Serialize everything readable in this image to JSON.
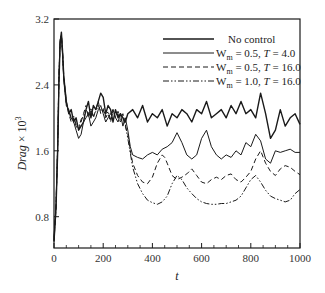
{
  "chart_data": {
    "type": "line",
    "title": "",
    "xlabel": "t",
    "ylabel": "Drag × 10³",
    "ylabel_parts": {
      "italic": "Drag",
      "rest": " × 10",
      "sup": "3"
    },
    "xlim": [
      0,
      1000
    ],
    "ylim": [
      0.42,
      3.2
    ],
    "xticks": [
      0,
      200,
      400,
      600,
      800,
      1000
    ],
    "xtick_labels": [
      "0",
      "200",
      "400",
      "600",
      "800",
      "1000"
    ],
    "yticks": [
      0.8,
      1.6,
      2.4,
      3.2
    ],
    "ytick_labels": [
      "0.8",
      "1.6",
      "2.4",
      "3.2"
    ],
    "grid": false,
    "legend_position": "upper right",
    "series": [
      {
        "name": "No control",
        "label_parts": [
          "No control"
        ],
        "style": "solid",
        "width": 1.4,
        "color": "#1a1a1a",
        "x": [
          0,
          8,
          15,
          20,
          25,
          30,
          35,
          40,
          50,
          60,
          70,
          80,
          90,
          100,
          110,
          120,
          130,
          140,
          150,
          160,
          170,
          180,
          190,
          200,
          210,
          220,
          230,
          240,
          250,
          260,
          270,
          280,
          290,
          300,
          320,
          340,
          360,
          380,
          400,
          420,
          440,
          460,
          480,
          500,
          520,
          540,
          560,
          580,
          600,
          620,
          640,
          660,
          680,
          700,
          720,
          740,
          760,
          780,
          800,
          820,
          840,
          860,
          880,
          900,
          920,
          940,
          960,
          980,
          1000
        ],
        "y": [
          0.5,
          0.9,
          1.6,
          2.4,
          2.9,
          3.04,
          2.8,
          2.5,
          2.2,
          2.05,
          2.1,
          1.95,
          2.0,
          1.85,
          1.9,
          1.95,
          2.1,
          2.2,
          2.0,
          2.15,
          2.1,
          2.2,
          2.3,
          2.25,
          2.05,
          2.15,
          2.1,
          1.95,
          2.1,
          2.0,
          2.05,
          2.0,
          1.95,
          2.05,
          2.1,
          2.0,
          2.15,
          1.95,
          2.05,
          2.0,
          2.1,
          1.9,
          2.05,
          2.0,
          2.1,
          2.05,
          1.95,
          2.1,
          2.05,
          2.2,
          2.0,
          2.05,
          2.1,
          2.0,
          2.15,
          2.05,
          2.2,
          2.05,
          2.1,
          2.0,
          2.3,
          2.05,
          1.75,
          1.85,
          2.1,
          1.9,
          2.0,
          2.05,
          1.92
        ]
      },
      {
        "name": "W_m = 0.5, T = 4.0",
        "label_parts": [
          "W",
          "m",
          " = 0.5,  ",
          "T",
          " = 4.0"
        ],
        "style": "solid",
        "width": 1.0,
        "color": "#1a1a1a",
        "x": [
          0,
          8,
          15,
          20,
          25,
          30,
          35,
          40,
          50,
          60,
          70,
          80,
          90,
          100,
          110,
          120,
          130,
          140,
          150,
          160,
          170,
          180,
          190,
          200,
          210,
          220,
          230,
          240,
          250,
          260,
          270,
          280,
          290,
          300,
          310,
          320,
          340,
          360,
          380,
          400,
          420,
          440,
          460,
          480,
          500,
          520,
          540,
          560,
          580,
          600,
          620,
          640,
          660,
          680,
          700,
          720,
          740,
          760,
          780,
          800,
          820,
          840,
          860,
          880,
          900,
          920,
          940,
          960,
          980,
          1000
        ],
        "y": [
          0.55,
          0.95,
          1.7,
          2.5,
          2.95,
          3.0,
          2.75,
          2.45,
          2.15,
          2.1,
          2.0,
          1.95,
          1.85,
          1.75,
          1.8,
          1.95,
          2.0,
          2.05,
          1.9,
          1.95,
          2.0,
          2.1,
          2.15,
          2.05,
          1.95,
          2.0,
          2.05,
          2.1,
          2.0,
          1.95,
          2.05,
          1.9,
          2.0,
          1.85,
          1.65,
          1.55,
          1.52,
          1.5,
          1.55,
          1.58,
          1.55,
          1.62,
          1.65,
          1.7,
          1.82,
          1.7,
          1.55,
          1.5,
          1.55,
          1.75,
          1.85,
          1.65,
          1.55,
          1.5,
          1.55,
          1.52,
          1.6,
          1.55,
          1.7,
          1.65,
          1.8,
          1.72,
          1.5,
          1.45,
          1.6,
          1.58,
          1.6,
          1.62,
          1.58,
          1.58
        ]
      },
      {
        "name": "W_m = 0.5, T = 16.0",
        "label_parts": [
          "W",
          "m",
          " = 0.5,  ",
          "T",
          " = 16.0"
        ],
        "style": "dashed",
        "width": 1.0,
        "color": "#1a1a1a",
        "x": [
          0,
          8,
          15,
          20,
          25,
          30,
          35,
          40,
          50,
          60,
          70,
          80,
          90,
          100,
          110,
          120,
          130,
          140,
          150,
          160,
          170,
          180,
          190,
          200,
          210,
          220,
          230,
          240,
          250,
          260,
          270,
          280,
          290,
          300,
          310,
          320,
          340,
          360,
          380,
          400,
          420,
          440,
          450,
          460,
          480,
          500,
          520,
          540,
          560,
          580,
          600,
          620,
          640,
          660,
          680,
          700,
          720,
          740,
          760,
          780,
          800,
          820,
          840,
          860,
          880,
          900,
          920,
          940,
          960,
          980,
          1000
        ],
        "y": [
          0.5,
          0.9,
          1.65,
          2.45,
          2.9,
          3.0,
          2.8,
          2.5,
          2.2,
          2.05,
          1.95,
          2.0,
          1.9,
          1.85,
          1.95,
          2.05,
          2.15,
          2.0,
          2.1,
          2.0,
          2.1,
          2.2,
          2.05,
          2.1,
          2.0,
          2.05,
          1.95,
          2.1,
          2.0,
          2.05,
          1.95,
          2.0,
          1.9,
          1.8,
          1.6,
          1.45,
          1.3,
          1.22,
          1.2,
          1.28,
          1.45,
          1.55,
          1.52,
          1.45,
          1.3,
          1.25,
          1.28,
          1.32,
          1.38,
          1.3,
          1.22,
          1.2,
          1.25,
          1.28,
          1.25,
          1.3,
          1.32,
          1.25,
          1.22,
          1.28,
          1.35,
          1.5,
          1.6,
          1.45,
          1.35,
          1.3,
          1.38,
          1.42,
          1.4,
          1.35,
          1.31
        ]
      },
      {
        "name": "W_m = 1.0, T = 16.0",
        "label_parts": [
          "W",
          "m",
          " = 1.0,  ",
          "T",
          " = 16.0"
        ],
        "style": "dashdotdot",
        "width": 1.0,
        "color": "#1a1a1a",
        "x": [
          0,
          8,
          15,
          20,
          25,
          30,
          35,
          40,
          50,
          60,
          70,
          80,
          90,
          100,
          110,
          120,
          130,
          140,
          150,
          160,
          170,
          180,
          190,
          200,
          210,
          220,
          230,
          240,
          250,
          260,
          270,
          280,
          290,
          300,
          320,
          340,
          360,
          380,
          400,
          420,
          440,
          460,
          480,
          500,
          520,
          540,
          560,
          580,
          600,
          620,
          640,
          660,
          680,
          700,
          720,
          740,
          760,
          780,
          800,
          820,
          840,
          860,
          880,
          900,
          920,
          940,
          960,
          980,
          1000
        ],
        "y": [
          0.52,
          0.92,
          1.68,
          2.5,
          2.92,
          3.02,
          2.78,
          2.48,
          2.18,
          2.08,
          1.98,
          2.02,
          1.92,
          1.88,
          1.98,
          2.02,
          2.1,
          2.05,
          2.12,
          2.02,
          2.08,
          2.15,
          2.08,
          2.12,
          2.02,
          2.08,
          1.98,
          2.05,
          2.02,
          2.08,
          1.98,
          2.05,
          1.92,
          1.75,
          1.4,
          1.2,
          1.08,
          1.0,
          0.97,
          0.95,
          0.98,
          1.05,
          1.2,
          1.3,
          1.25,
          1.15,
          1.08,
          1.02,
          0.98,
          0.96,
          0.95,
          0.95,
          0.96,
          0.96,
          0.98,
          1.0,
          1.05,
          1.15,
          1.25,
          1.3,
          1.22,
          1.12,
          1.05,
          1.02,
          1.0,
          0.98,
          1.0,
          1.08,
          1.13
        ]
      }
    ]
  },
  "layout": {
    "plot": {
      "left": 54,
      "top": 19,
      "right": 300,
      "bottom": 248
    }
  }
}
